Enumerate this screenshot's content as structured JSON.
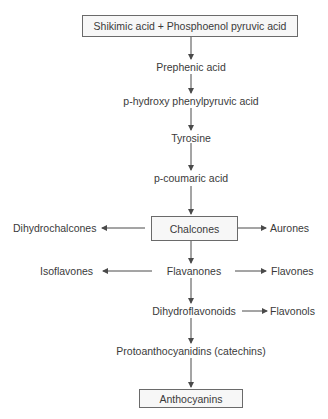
{
  "diagram": {
    "type": "flowchart",
    "nodes": {
      "start": "Shikimic acid + Phosphoenol pyruvic acid",
      "prephenic": "Prephenic acid",
      "phydroxy": "p-hydroxy phenylpyruvic acid",
      "tyrosine": "Tyrosine",
      "pcoumaric": "p-coumaric acid",
      "chalcones": "Chalcones",
      "dihydrochalcones": "Dihydrochalcones",
      "aurones": "Aurones",
      "flavanones": "Flavanones",
      "isoflavones": "Isoflavones",
      "flavones": "Flavones",
      "dihydroflavonoids": "Dihydroflavonoids",
      "flavonols": "Flavonols",
      "protoanthocyanidins": "Protoanthocyanidins (catechins)",
      "anthocyanins": "Anthocyanins"
    },
    "edges": [
      [
        "start",
        "prephenic"
      ],
      [
        "prephenic",
        "phydroxy"
      ],
      [
        "phydroxy",
        "tyrosine"
      ],
      [
        "tyrosine",
        "pcoumaric"
      ],
      [
        "pcoumaric",
        "chalcones"
      ],
      [
        "chalcones",
        "dihydrochalcones"
      ],
      [
        "chalcones",
        "aurones"
      ],
      [
        "chalcones",
        "flavanones"
      ],
      [
        "flavanones",
        "isoflavones"
      ],
      [
        "flavanones",
        "flavones"
      ],
      [
        "flavanones",
        "dihydroflavonoids"
      ],
      [
        "dihydroflavonoids",
        "flavonols"
      ],
      [
        "dihydroflavonoids",
        "protoanthocyanidins"
      ],
      [
        "protoanthocyanidins",
        "anthocyanins"
      ]
    ],
    "boxed_nodes": [
      "start",
      "chalcones",
      "anthocyanins"
    ],
    "colors": {
      "line": "#4a4a4a",
      "box_border": "#6a6a6a",
      "box_fill": "#f7f7f7",
      "text": "#3a3a3a"
    }
  }
}
